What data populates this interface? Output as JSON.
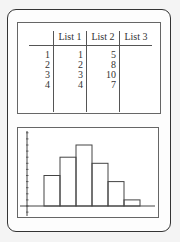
{
  "table": {
    "headers": [
      "",
      "List 1",
      "List 2",
      "List 3"
    ],
    "rows": [
      [
        "1",
        "1",
        "5",
        ""
      ],
      [
        "2",
        "2",
        "8",
        ""
      ],
      [
        "3",
        "3",
        "10",
        ""
      ],
      [
        "4",
        "4",
        "7",
        ""
      ]
    ]
  },
  "chart_data": {
    "type": "bar",
    "title": "",
    "xlabel": "",
    "ylabel": "",
    "categories": [
      "1",
      "2",
      "3",
      "4",
      "5",
      "6"
    ],
    "values": [
      5,
      8,
      10,
      7,
      4,
      1
    ],
    "ylim": [
      0,
      12
    ],
    "grid": false,
    "legend": "none"
  }
}
